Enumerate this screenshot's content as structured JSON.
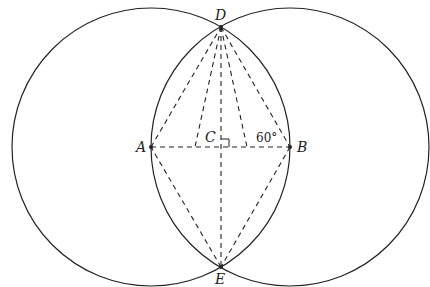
{
  "diagram": {
    "circles": [
      {
        "name": "circle-A",
        "center": "A",
        "cx": 151,
        "cy": 147,
        "r": 139
      },
      {
        "name": "circle-B",
        "center": "B",
        "cx": 290,
        "cy": 147,
        "r": 139
      }
    ],
    "points": {
      "A": {
        "label": "A",
        "x": 151,
        "y": 147
      },
      "B": {
        "label": "B",
        "x": 290,
        "y": 147
      },
      "C": {
        "label": "C",
        "x": 221,
        "y": 147
      },
      "D": {
        "label": "D",
        "x": 221,
        "y": 27
      },
      "E": {
        "label": "E",
        "x": 221,
        "y": 267
      }
    },
    "dashed_segments": [
      "AD",
      "DB",
      "BE",
      "EA",
      "AB",
      "DE"
    ],
    "right_angle_marker": "C",
    "angle_label": "60°",
    "colors": {
      "stroke": "#222222",
      "background": "#ffffff"
    }
  }
}
